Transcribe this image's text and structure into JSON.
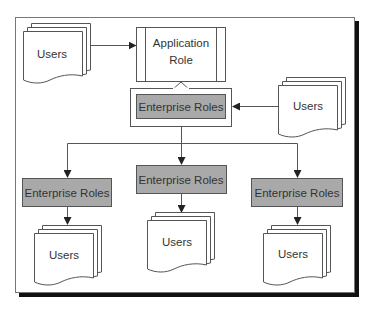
{
  "diagram": {
    "colors": {
      "line": "#555555",
      "role_fill": "#a9a9a9",
      "shadow": "#111111",
      "background": "#ffffff"
    },
    "application_role": {
      "line1": "Application",
      "line2": "Role"
    },
    "central_role": {
      "label": "Enterprise Roles"
    },
    "child_roles": [
      {
        "label": "Enterprise Roles"
      },
      {
        "label": "Enterprise Roles"
      },
      {
        "label": "Enterprise Roles"
      }
    ],
    "users": {
      "top_left": {
        "label": "Users"
      },
      "right": {
        "label": "Users"
      },
      "bottom_left": {
        "label": "Users"
      },
      "bottom_middle": {
        "label": "Users"
      },
      "bottom_right": {
        "label": "Users"
      }
    },
    "edges": [
      {
        "from": "users.top_left",
        "to": "application_role",
        "style": "arrow"
      },
      {
        "from": "central_role",
        "to": "application_role",
        "style": "hollow-block-arrow"
      },
      {
        "from": "users.right",
        "to": "central_role",
        "style": "arrow"
      },
      {
        "from": "central_role",
        "to": "child_roles.0",
        "style": "arrow"
      },
      {
        "from": "central_role",
        "to": "child_roles.1",
        "style": "arrow"
      },
      {
        "from": "central_role",
        "to": "child_roles.2",
        "style": "arrow"
      },
      {
        "from": "child_roles.0",
        "to": "users.bottom_left",
        "style": "arrow"
      },
      {
        "from": "child_roles.1",
        "to": "users.bottom_middle",
        "style": "arrow"
      },
      {
        "from": "child_roles.2",
        "to": "users.bottom_right",
        "style": "arrow"
      }
    ]
  }
}
